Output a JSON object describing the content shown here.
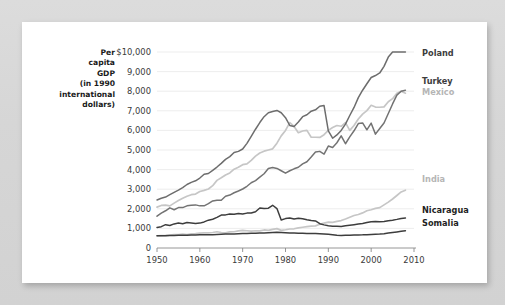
{
  "card": {
    "background_color": "#ffffff",
    "page_background_color": "#d9d9d9"
  },
  "chart_data": {
    "type": "line",
    "title": "",
    "ylabel": "Per capita GDP (in 1990 international dollars)",
    "ylabel_lines": [
      "Per",
      "capita",
      "GDP",
      "(in 1990",
      "international",
      "dollars)"
    ],
    "xlabel": "",
    "xlim": [
      1950,
      2010
    ],
    "ylim": [
      0,
      10000
    ],
    "grid": true,
    "legend_position": "right-inline-labels",
    "ytick_labels": [
      "$10,000",
      "9,000",
      "8,000",
      "7,000",
      "6,000",
      "5,000",
      "4,000",
      "3,000",
      "2,000",
      "1,000",
      "0"
    ],
    "ytick_values": [
      10000,
      9000,
      8000,
      7000,
      6000,
      5000,
      4000,
      3000,
      2000,
      1000,
      0
    ],
    "xtick_labels": [
      "1950",
      "1960",
      "1970",
      "1980",
      "1990",
      "2000",
      "2010"
    ],
    "xtick_values": [
      1950,
      1960,
      1970,
      1980,
      1990,
      2000,
      2010
    ],
    "x": [
      1950,
      1951,
      1952,
      1953,
      1954,
      1955,
      1956,
      1957,
      1958,
      1959,
      1960,
      1961,
      1962,
      1963,
      1964,
      1965,
      1966,
      1967,
      1968,
      1969,
      1970,
      1971,
      1972,
      1973,
      1974,
      1975,
      1976,
      1977,
      1978,
      1979,
      1980,
      1981,
      1982,
      1983,
      1984,
      1985,
      1986,
      1987,
      1988,
      1989,
      1990,
      1991,
      1992,
      1993,
      1994,
      1995,
      1996,
      1997,
      1998,
      1999,
      2000,
      2001,
      2002,
      2003,
      2004,
      2005,
      2006,
      2007,
      2008
    ],
    "series": [
      {
        "name": "Poland",
        "color": "#6d6d6d",
        "label_color": "#3d3d3d",
        "label_bold": true,
        "values": [
          2447,
          2540,
          2600,
          2720,
          2840,
          2950,
          3080,
          3240,
          3350,
          3430,
          3570,
          3760,
          3800,
          3960,
          4130,
          4320,
          4520,
          4660,
          4870,
          4930,
          5050,
          5340,
          5700,
          6060,
          6400,
          6700,
          6900,
          6960,
          7020,
          6900,
          6650,
          6250,
          6200,
          6430,
          6700,
          6800,
          6980,
          7050,
          7230,
          7270,
          5970,
          5600,
          5770,
          6000,
          6320,
          6760,
          7170,
          7670,
          8050,
          8380,
          8700,
          8800,
          8930,
          9270,
          9740,
          10000,
          10500,
          11000,
          11200
        ]
      },
      {
        "name": "Turkey",
        "color": "#737373",
        "label_color": "#3d3d3d",
        "label_bold": true,
        "values": [
          1623,
          1780,
          1900,
          2050,
          1950,
          2060,
          2060,
          2150,
          2180,
          2200,
          2150,
          2150,
          2260,
          2400,
          2440,
          2440,
          2640,
          2700,
          2820,
          2910,
          3010,
          3150,
          3330,
          3440,
          3620,
          3790,
          4060,
          4110,
          4060,
          3940,
          3820,
          3940,
          4040,
          4120,
          4290,
          4400,
          4640,
          4900,
          4930,
          4790,
          5200,
          5130,
          5370,
          5720,
          5320,
          5670,
          5980,
          6350,
          6380,
          6030,
          6370,
          5810,
          6100,
          6380,
          6860,
          7350,
          7800,
          8000,
          8050
        ]
      },
      {
        "name": "Mexico",
        "color": "#c6c6c6",
        "label_color": "#b5b5b5",
        "label_bold": true,
        "values": [
          2085,
          2170,
          2190,
          2150,
          2290,
          2420,
          2540,
          2640,
          2720,
          2750,
          2880,
          2940,
          3010,
          3180,
          3450,
          3580,
          3720,
          3830,
          4020,
          4120,
          4250,
          4290,
          4470,
          4690,
          4850,
          4940,
          5000,
          5060,
          5350,
          5720,
          6000,
          6400,
          6200,
          5880,
          5970,
          6000,
          5650,
          5650,
          5640,
          5780,
          6000,
          6150,
          6250,
          6210,
          6400,
          6000,
          6250,
          6580,
          6830,
          7010,
          7280,
          7190,
          7180,
          7200,
          7460,
          7620,
          7900,
          8000,
          7900
        ]
      },
      {
        "name": "India",
        "color": "#c6c6c6",
        "label_color": "#b5b5b5",
        "label_bold": true,
        "values": [
          619,
          630,
          640,
          660,
          680,
          690,
          710,
          690,
          720,
          730,
          760,
          770,
          770,
          790,
          830,
          790,
          770,
          820,
          830,
          870,
          900,
          880,
          860,
          880,
          870,
          920,
          900,
          950,
          990,
          900,
          930,
          970,
          980,
          1030,
          1060,
          1090,
          1120,
          1130,
          1210,
          1270,
          1320,
          1310,
          1360,
          1400,
          1480,
          1570,
          1660,
          1710,
          1790,
          1900,
          1950,
          2020,
          2060,
          2200,
          2340,
          2500,
          2680,
          2860,
          2950
        ]
      },
      {
        "name": "Nicaragua",
        "color": "#3d3d3d",
        "label_color": "#1f1f1f",
        "label_bold": true,
        "values": [
          1050,
          1090,
          1190,
          1150,
          1230,
          1270,
          1240,
          1300,
          1280,
          1250,
          1270,
          1330,
          1420,
          1470,
          1560,
          1680,
          1690,
          1740,
          1720,
          1760,
          1730,
          1780,
          1790,
          1850,
          2040,
          2010,
          2030,
          2180,
          2010,
          1430,
          1500,
          1530,
          1480,
          1520,
          1490,
          1440,
          1400,
          1380,
          1240,
          1180,
          1130,
          1110,
          1110,
          1100,
          1130,
          1160,
          1190,
          1220,
          1250,
          1300,
          1340,
          1350,
          1340,
          1350,
          1390,
          1420,
          1460,
          1510,
          1530
        ]
      },
      {
        "name": "Somalia",
        "color": "#3d3d3d",
        "label_color": "#1f1f1f",
        "label_bold": true,
        "values": [
          620,
          625,
          630,
          635,
          640,
          645,
          650,
          655,
          660,
          665,
          670,
          672,
          675,
          680,
          690,
          700,
          710,
          715,
          720,
          730,
          740,
          745,
          750,
          755,
          760,
          765,
          775,
          790,
          800,
          790,
          780,
          770,
          760,
          755,
          750,
          745,
          740,
          735,
          730,
          720,
          700,
          680,
          650,
          640,
          645,
          650,
          660,
          665,
          670,
          680,
          690,
          700,
          710,
          730,
          760,
          790,
          820,
          850,
          880
        ]
      }
    ],
    "annotations": [
      {
        "series": "Nicaragua",
        "note": "sharp decline after 1978"
      },
      {
        "series": "Poland",
        "note": "dip around 1990-1991"
      }
    ]
  }
}
